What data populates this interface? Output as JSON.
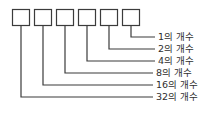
{
  "diagram": {
    "background_color": "#ffffff",
    "stroke_color": "#3b3b3b",
    "text_color": "#2e2e2e",
    "box_count": 6,
    "boxes": [
      {
        "id": "box-32",
        "value": "",
        "place": "32"
      },
      {
        "id": "box-16",
        "value": "",
        "place": "16"
      },
      {
        "id": "box-8",
        "value": "",
        "place": "8"
      },
      {
        "id": "box-4",
        "value": "",
        "place": "4"
      },
      {
        "id": "box-2",
        "value": "",
        "place": "2"
      },
      {
        "id": "box-1",
        "value": "",
        "place": "1"
      }
    ],
    "labels": [
      {
        "id": "label-1",
        "text": "1의 개수"
      },
      {
        "id": "label-2",
        "text": "2의 개수"
      },
      {
        "id": "label-4",
        "text": "4의 개수"
      },
      {
        "id": "label-8",
        "text": "8의 개수"
      },
      {
        "id": "label-16",
        "text": "16의 개수"
      },
      {
        "id": "label-32",
        "text": "32의 개수"
      }
    ]
  }
}
